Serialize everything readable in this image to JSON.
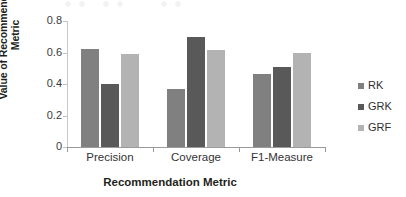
{
  "chart_data": {
    "type": "bar",
    "title": "",
    "xlabel": "Recommendation Metric",
    "ylabel": "Value of Recommendation\nMetric",
    "categories": [
      "Precision",
      "Coverage",
      "F1-Measure"
    ],
    "series": [
      {
        "name": "RK",
        "color": "#808080",
        "values": [
          0.62,
          0.37,
          0.465
        ]
      },
      {
        "name": "GRK",
        "color": "#595959",
        "values": [
          0.4,
          0.7,
          0.51
        ]
      },
      {
        "name": "GRF",
        "color": "#b3b3b3",
        "values": [
          0.59,
          0.615,
          0.6
        ]
      }
    ],
    "ylim": [
      0,
      0.8
    ],
    "yticks": [
      "0",
      "0.2",
      "0.4",
      "0.6",
      "0.8"
    ],
    "ytick_values": [
      0,
      0.2,
      0.4,
      0.6,
      0.8
    ],
    "grid": false,
    "legend_position": "right"
  },
  "legend": {
    "items": [
      {
        "label": "RK",
        "color": "#808080"
      },
      {
        "label": "GRK",
        "color": "#595959"
      },
      {
        "label": "GRF",
        "color": "#b3b3b3"
      }
    ]
  },
  "axis": {
    "y_title": "Value of Recommendation\nMetric",
    "x_title": "Recommendation Metric"
  }
}
